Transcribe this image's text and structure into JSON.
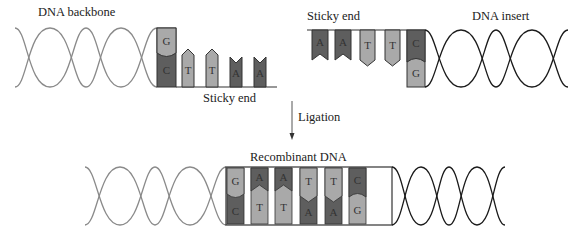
{
  "labels": {
    "dna_backbone": "DNA backbone",
    "sticky_end_left": "Sticky end",
    "sticky_end_right": "Sticky end",
    "dna_insert": "DNA insert",
    "ligation": "Ligation",
    "recombinant_dna": "Recombinant DNA"
  },
  "backbone_fragment": {
    "paired_base": {
      "top": "G",
      "bottom": "C"
    },
    "sticky_bases": [
      "T",
      "T",
      "A",
      "A"
    ]
  },
  "insert_fragment": {
    "sticky_bases": [
      "A",
      "A",
      "T",
      "T"
    ],
    "paired_base": {
      "top": "C",
      "bottom": "G"
    }
  },
  "recombinant": {
    "top": [
      "G",
      "A",
      "A",
      "T",
      "T",
      "C"
    ],
    "bottom": [
      "C",
      "T",
      "T",
      "A",
      "A",
      "G"
    ]
  },
  "colors": {
    "backbone_helix": "#8a8a8a",
    "insert_helix": "#1a1a1a",
    "dark_base": "#5e5e5e",
    "light_base": "#a9a9a9",
    "mid_base": "#7c7c7c",
    "outline": "#333333"
  }
}
